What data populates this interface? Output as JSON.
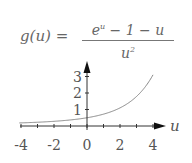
{
  "formula": {
    "lhs": "g(u) =",
    "numerator_base": "e",
    "numerator_exp": "u",
    "numerator_rest": " − 1 − u",
    "denominator_base": "u",
    "denominator_exp": "2"
  },
  "chart_data": {
    "type": "line",
    "xlabel": "u",
    "ylabel": "",
    "xlim": [
      -4,
      4
    ],
    "ylim": [
      0,
      3.2
    ],
    "x_ticks": [
      -4,
      -3,
      -2,
      -1,
      0,
      1,
      2,
      3,
      4
    ],
    "x_tick_labels": [
      "-4",
      "-2",
      "0",
      "2",
      "4"
    ],
    "x_tick_label_values": [
      -4,
      -2,
      0,
      2,
      4
    ],
    "y_tick_labels": [
      "1",
      "2",
      "3"
    ],
    "y_tick_label_values": [
      1,
      2,
      3
    ],
    "grid": false,
    "legend": null,
    "series": [
      {
        "name": "g(u)",
        "x": [
          -4,
          -3,
          -2,
          -1,
          0,
          1,
          2,
          3,
          4
        ],
        "y": [
          0.12,
          0.17,
          0.28,
          0.37,
          0.5,
          0.72,
          1.1,
          1.79,
          3.1
        ]
      }
    ],
    "colors": {
      "curve": "#888888",
      "axes": "#333333",
      "text": "#555555"
    }
  }
}
